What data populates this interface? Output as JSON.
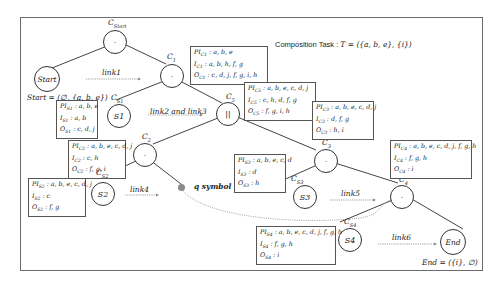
{
  "title": {
    "label": "Composition Task :",
    "formula": "T = ({a, b, e}, {i})"
  },
  "nodes": {
    "c_start": {
      "label": "C",
      "sub": "Start",
      "symbol": "·"
    },
    "start": {
      "symbol": "Start",
      "definition": "Start = (∅, {a, b, e})"
    },
    "c1": {
      "label": "C",
      "sub": "1",
      "symbol": "·"
    },
    "s1": {
      "label": "C",
      "sub": "S1",
      "symbol": "S1"
    },
    "c2_par": {
      "label": "C",
      "sub": "5",
      "symbol": "||"
    },
    "c2": {
      "label": "C",
      "sub": "2",
      "symbol": "·"
    },
    "s2": {
      "label": "C",
      "sub": "S2",
      "symbol": "S2"
    },
    "c3": {
      "label": "C",
      "sub": "3",
      "symbol": "·"
    },
    "s3": {
      "label": "C",
      "sub": "S3",
      "symbol": "S3"
    },
    "c4": {
      "label": "C",
      "sub": "4",
      "symbol": "·"
    },
    "s4": {
      "label": "C",
      "sub": "S4",
      "symbol": "S4"
    },
    "end": {
      "symbol": "End",
      "definition": "End = ({i}, ∅)"
    }
  },
  "links": {
    "link1": "link1",
    "link23": "link2 and link3",
    "link4": "link4",
    "link5": "link5",
    "link6": "link6",
    "q_symbol": "q symbol"
  },
  "boxes": {
    "c1": {
      "pi": "a, b, e",
      "i": "a, b, h, f, g",
      "o": "c, d, j, f, g, i, h"
    },
    "s1": {
      "pi": "a, b, e",
      "i": "a, b",
      "o": "c, d, j"
    },
    "c5": {
      "pi": "a, b, e, c, d, j",
      "i": "c, h, d, f, g",
      "o": "f, g, i, h"
    },
    "c2": {
      "pi": "a, b, e, c, d, j",
      "i": "c, h",
      "o": "f, g, i"
    },
    "c3": {
      "pi": "a, b, e, c, d, j",
      "i": "d, f, g",
      "o": "h, i"
    },
    "s2": {
      "pi": "a, b, e, c, d, j",
      "i": "c",
      "o": "f, g"
    },
    "s3": {
      "pi": "a, b, e, c, d",
      "i": "d",
      "o": "h"
    },
    "c4": {
      "pi": "a, b, e, c, d, j, f, g, h",
      "i": "f, g, h",
      "o": "i"
    },
    "s4": {
      "pi": "a, b, e, c, d, j, f, g, h",
      "i": "f, g, h",
      "o": "i"
    }
  },
  "colors": {
    "line": "#444444",
    "q_dot": "#8a8a8a",
    "dotted": "#9a9a9a"
  }
}
